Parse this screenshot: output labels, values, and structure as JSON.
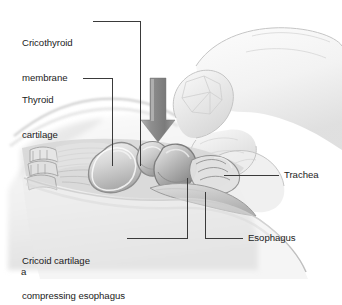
{
  "figure": {
    "panel_label": "a",
    "background_color": "#ffffff",
    "line_color": "#3a3a3a",
    "text_color": "#1b1b1b",
    "arrow_color": "#8a8a8a"
  },
  "labels": {
    "cricothyroid_membrane": {
      "line1": "Cricothyroid",
      "line2": "membrane"
    },
    "thyroid_cartilage": {
      "line1": "Thyroid",
      "line2": "cartilage"
    },
    "cricoid_cartilage": {
      "line1": "Cricoid cartilage",
      "line2": "compressing esophagus"
    },
    "trachea": "Trachea",
    "esophagus": "Esophagus"
  },
  "illustration": {
    "arrow": {
      "name": "downward-pressure-arrow",
      "direction": "down",
      "color_top": "#9a9a9a",
      "color_bottom": "#6f6f6f"
    },
    "structures": [
      "hand-applying-pressure",
      "thyroid-cartilage",
      "cricothyroid-membrane",
      "cricoid-cartilage",
      "trachea",
      "esophagus",
      "hyoid-bone",
      "cervical-vertebrae",
      "neck-soft-tissue"
    ]
  }
}
